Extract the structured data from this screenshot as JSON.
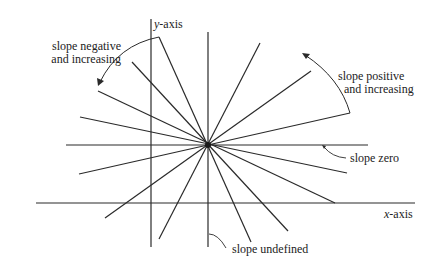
{
  "diagram": {
    "title": "",
    "axes": {
      "x_label_var": "x",
      "x_label_rest": "-axis",
      "y_label_var": "y",
      "y_label_rest": "-axis"
    },
    "annotations": {
      "neg_line1": "slope negative",
      "neg_line2": "and increasing",
      "pos_line1": "slope positive",
      "pos_line2": "and increasing",
      "zero": "slope zero",
      "undefined": "slope undefined"
    },
    "center": [
      207,
      145
    ],
    "colors": {
      "line": "#2a2a2a",
      "background": "#ffffff"
    }
  }
}
